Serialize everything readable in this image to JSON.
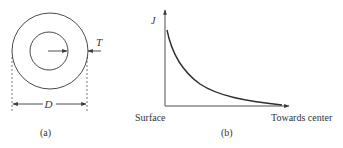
{
  "figure": {
    "panel_a": {
      "caption": "(a)",
      "thickness_label": "T",
      "diameter_label": "D",
      "outer_circle": {
        "cx": 50,
        "cy": 51,
        "r": 38
      },
      "inner_circle": {
        "cx": 49,
        "cy": 51,
        "r": 19
      }
    },
    "panel_b": {
      "caption": "(b)",
      "y_axis_label": "J",
      "x_axis_left_label": "Surface",
      "x_axis_right_label": "Towards center"
    },
    "colors": {
      "line": "#3a3a3a",
      "text": "#333333",
      "background": "#ffffff"
    }
  }
}
